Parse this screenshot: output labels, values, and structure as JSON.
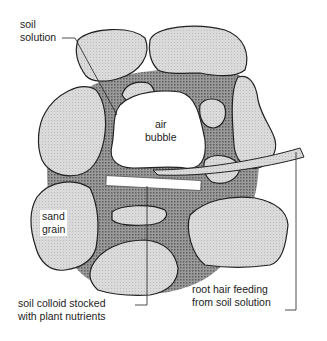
{
  "diagram": {
    "labels": {
      "soil_solution": [
        "soil",
        "solution"
      ],
      "air_bubble": [
        "air",
        "bubble"
      ],
      "sand_grain": [
        "sand",
        "grain"
      ],
      "soil_colloid": [
        "soil colloid stocked",
        "with plant nutrients"
      ],
      "root_hair": [
        "root hair feeding",
        "from soil solution"
      ]
    },
    "colors": {
      "sand_grain_fill": "#d9d9d9",
      "soil_solution_fill": "#8a8a8a",
      "outline": "#222222",
      "air_bubble_fill": "#ffffff",
      "colloid_fill": "#ffffff"
    }
  }
}
